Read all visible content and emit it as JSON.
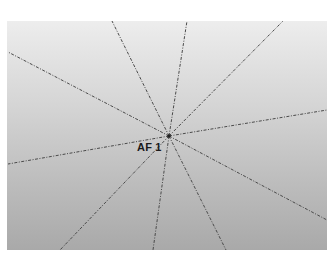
{
  "diagram": {
    "type": "af-point-radial-lines",
    "label": "AF 1",
    "center": {
      "x": 169,
      "y": 136
    },
    "panel": {
      "x": 7,
      "y": 21,
      "width": 320,
      "height": 229,
      "gradient_top": "#ededed",
      "gradient_bottom": "#a9a9a9"
    },
    "line_color": "#4a4a4a",
    "line_style": "dash-dot",
    "ray_endpoints": [
      {
        "x": 8,
        "y": 52
      },
      {
        "x": 112,
        "y": 21
      },
      {
        "x": 187,
        "y": 21
      },
      {
        "x": 283,
        "y": 21
      },
      {
        "x": 327,
        "y": 110
      },
      {
        "x": 327,
        "y": 220
      },
      {
        "x": 226,
        "y": 250
      },
      {
        "x": 153,
        "y": 250
      },
      {
        "x": 60,
        "y": 250
      },
      {
        "x": 8,
        "y": 164
      }
    ]
  }
}
